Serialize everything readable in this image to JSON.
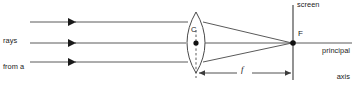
{
  "figure": {
    "kind": "ray-diagram",
    "background_color": "#ffffff",
    "stroke_color": "#5a5a5a",
    "dark_stroke_color": "#333333",
    "text_color": "#1a1a1a"
  },
  "labels": {
    "rays_source": {
      "line1": "rays",
      "line2": "from a",
      "line3": "distant",
      "line4": "object"
    },
    "lens_center": "C",
    "screen": "screen",
    "focal_point": "F",
    "principal_axis": {
      "line1": "principal",
      "line2": "axis"
    },
    "focal_length": "f"
  },
  "geometry": {
    "lens_center_x": 196,
    "lens_center_y": 43,
    "lens_top_y": 12,
    "lens_bottom_y": 73,
    "focal_point_x": 293,
    "focal_point_y": 43,
    "screen_x": 293,
    "screen_top_y": 5,
    "screen_bottom_y": 80,
    "incoming_ray_y": [
      22,
      43,
      62
    ],
    "incoming_ray_start_x": 30,
    "arrowhead_x": 76,
    "dimension_line_y": 73
  }
}
